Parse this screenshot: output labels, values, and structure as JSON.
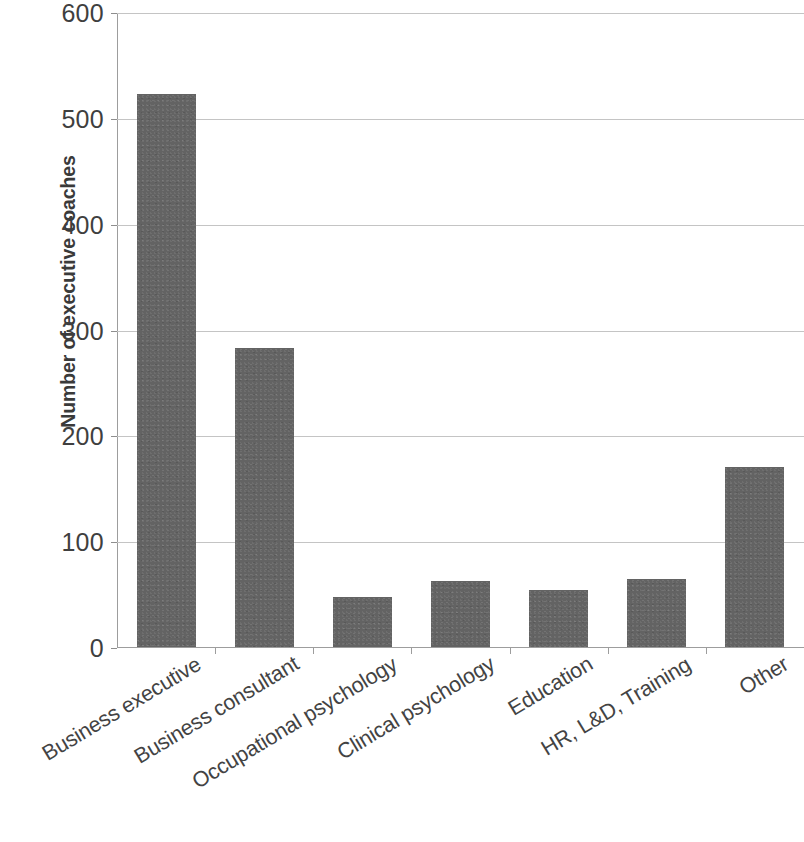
{
  "chart_data": {
    "type": "bar",
    "title": "",
    "xlabel": "",
    "ylabel": "Number of executive coaches",
    "categories": [
      "Business executive",
      "Business consultant",
      "Occupational psychology",
      "Clinical psychology",
      "Education",
      "HR, L&D, Training",
      "Other"
    ],
    "values": [
      523,
      283,
      47,
      62,
      54,
      64,
      170
    ],
    "ylim": [
      0,
      600
    ],
    "y_ticks": [
      0,
      100,
      200,
      300,
      400,
      500,
      600
    ],
    "y_tick_labels": [
      "0",
      "100",
      "200",
      "300",
      "400",
      "500",
      "600"
    ],
    "grid": "horizontal",
    "legend": "none",
    "bar_color": "#636363",
    "gridline_color": "#c4c4c4",
    "axis_color": "#9d9d9d",
    "text_color": "#434343"
  }
}
